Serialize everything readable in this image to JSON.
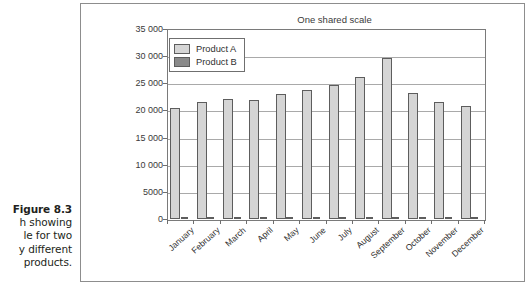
{
  "caption": {
    "lines": [
      {
        "text": "Figure 8.3",
        "bold": true
      },
      {
        "text": "h showing",
        "bold": false
      },
      {
        "text": "le for two",
        "bold": false
      },
      {
        "text": "y different",
        "bold": false
      },
      {
        "text": "products.",
        "bold": false
      }
    ]
  },
  "chart_data": {
    "type": "bar",
    "title": "One shared scale",
    "xlabel": "",
    "ylabel": "",
    "ylim": [
      0,
      35000
    ],
    "grid": true,
    "legend_position": "top-left",
    "categories": [
      "January",
      "February",
      "March",
      "April",
      "May",
      "June",
      "July",
      "August",
      "September",
      "October",
      "November",
      "December"
    ],
    "series": [
      {
        "name": "Product A",
        "color": "#d5d5d5",
        "values": [
          20400,
          21600,
          22100,
          22000,
          23100,
          23700,
          24700,
          26200,
          29600,
          23200,
          21600,
          20800
        ]
      },
      {
        "name": "Product B",
        "color": "#8a8a8a",
        "values": [
          390,
          380,
          380,
          370,
          360,
          350,
          340,
          330,
          320,
          300,
          300,
          290
        ]
      }
    ],
    "ytick_labels": [
      "35 000",
      "30 000",
      "25 000",
      "20 000",
      "15 000",
      "10 000",
      "5000",
      "0"
    ],
    "ytick_values": [
      35000,
      30000,
      25000,
      20000,
      15000,
      10000,
      5000,
      0
    ]
  }
}
